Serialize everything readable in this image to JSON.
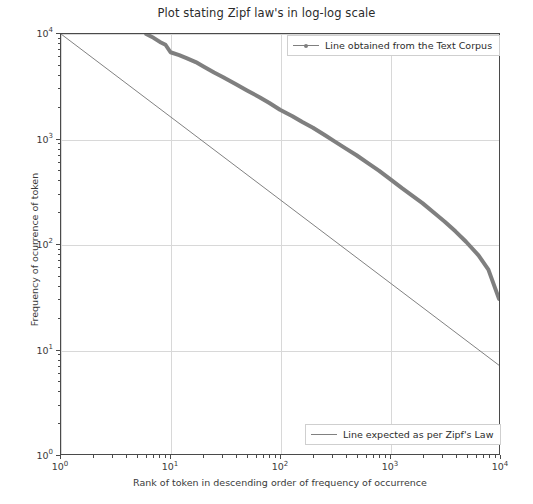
{
  "chart_data": {
    "type": "line",
    "title": "Plot stating Zipf law's in log-log scale",
    "xlabel": "Rank of token in descending order of frequency of occurrence",
    "ylabel": "Frequency of ocurrence of token",
    "xscale": "log",
    "yscale": "log",
    "xlim": [
      1,
      10000
    ],
    "ylim": [
      1,
      10000
    ],
    "grid": true,
    "xticks": [
      "10⁰",
      "10¹",
      "10²",
      "10³",
      "10⁴"
    ],
    "xtick_values": [
      1,
      10,
      100,
      1000,
      10000
    ],
    "yticks": [
      "10⁰",
      "10¹",
      "10²",
      "10³",
      "10⁴"
    ],
    "ytick_values": [
      1,
      10,
      100,
      1000,
      10000
    ],
    "legend_position": "upper right and lower right",
    "series": [
      {
        "name": "Line obtained from the Text Corpus",
        "color": "#7f7f7f",
        "marker": "dot",
        "linewidth": 4,
        "x": [
          6,
          7,
          8,
          9,
          10,
          12,
          14,
          17,
          20,
          25,
          30,
          40,
          50,
          65,
          80,
          100,
          130,
          160,
          200,
          260,
          320,
          400,
          500,
          650,
          800,
          1000,
          1300,
          1600,
          2000,
          2600,
          3200,
          4000,
          5000,
          6500,
          8000,
          10000
        ],
        "y": [
          10000,
          9200,
          8400,
          7900,
          6700,
          6300,
          5900,
          5400,
          4900,
          4300,
          3900,
          3300,
          2900,
          2500,
          2200,
          1900,
          1650,
          1450,
          1280,
          1080,
          940,
          810,
          700,
          580,
          500,
          420,
          340,
          290,
          245,
          195,
          163,
          132,
          105,
          78,
          57,
          30
        ]
      },
      {
        "name": "Line expected as per Zipf's Law",
        "color": "#808080",
        "marker": "none",
        "linewidth": 1,
        "x": [
          1,
          10000
        ],
        "y": [
          10000,
          7
        ]
      }
    ]
  },
  "legend": {
    "top": {
      "label": "Line obtained from the Text Corpus"
    },
    "bottom": {
      "label": "Line expected as per Zipf's Law"
    }
  },
  "axes": {
    "x_ticklabels": [
      {
        "base": "10",
        "exp": "0"
      },
      {
        "base": "10",
        "exp": "1"
      },
      {
        "base": "10",
        "exp": "2"
      },
      {
        "base": "10",
        "exp": "3"
      },
      {
        "base": "10",
        "exp": "4"
      }
    ],
    "y_ticklabels": [
      {
        "base": "10",
        "exp": "0"
      },
      {
        "base": "10",
        "exp": "1"
      },
      {
        "base": "10",
        "exp": "2"
      },
      {
        "base": "10",
        "exp": "3"
      },
      {
        "base": "10",
        "exp": "4"
      }
    ]
  }
}
